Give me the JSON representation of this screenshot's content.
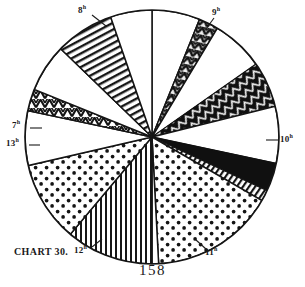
{
  "figure": {
    "caption": "CHART 30.",
    "folio": "158",
    "center": {
      "x": 152,
      "y": 137
    },
    "radius": 127,
    "outline_color": "#151515"
  },
  "labels": [
    {
      "id": "h8",
      "text": "8",
      "unit": "h",
      "x": 78,
      "y": 9,
      "anchor": "start"
    },
    {
      "id": "h9",
      "text": "9",
      "unit": "h",
      "x": 212,
      "y": 11,
      "anchor": "start"
    },
    {
      "id": "h10",
      "text": "10",
      "unit": "h",
      "x": 280,
      "y": 138,
      "anchor": "start"
    },
    {
      "id": "h11",
      "text": "11",
      "unit": "h",
      "x": 208,
      "y": 251,
      "anchor": "start"
    },
    {
      "id": "h12",
      "text": "12",
      "unit": "h",
      "x": 76,
      "y": 249,
      "anchor": "start"
    },
    {
      "id": "h13",
      "text": "13",
      "unit": "h",
      "x": 9,
      "y": 142,
      "anchor": "start"
    },
    {
      "id": "h7",
      "text": "7",
      "unit": "h",
      "x": 14,
      "y": 124,
      "anchor": "start"
    }
  ],
  "chart_data": {
    "type": "pie",
    "title": "CHART 30.",
    "xlabel": "",
    "ylabel": "",
    "units": "hours of the day",
    "tick_labels": [
      "7h",
      "8h",
      "9h",
      "10h",
      "11h",
      "12h",
      "13h"
    ],
    "total_degrees": 360,
    "legend_position": "none",
    "grid": false,
    "categories": [
      "8h blank",
      "8h-9h zigzag wedge",
      "9h blank",
      "9h solid black wedge",
      "9h-10h blank",
      "10h solid black",
      "10h hatched band",
      "10h-11h stipple",
      "11h blank sliver",
      "11h-12h vertical rule",
      "12h stipple",
      "12h-13h blank",
      "13h zigzag band",
      "13h blank",
      "7h diagonal rule",
      "7h-8h blank"
    ],
    "values": [
      22,
      9,
      24,
      21,
      26,
      13,
      5,
      57,
      3,
      40,
      37,
      25,
      10,
      22,
      27,
      19
    ],
    "fills": [
      "blank",
      "zigzag",
      "blank",
      "solid",
      "blank",
      "solid",
      "hatch-fine",
      "stipple",
      "blank",
      "vertical",
      "stipple",
      "blank",
      "zigzag",
      "blank",
      "diagonal",
      "blank"
    ],
    "start_angle_deg": -90,
    "direction": "clockwise"
  }
}
